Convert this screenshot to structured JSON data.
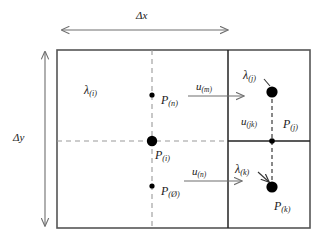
{
  "figure": {
    "type": "diagram",
    "title": "",
    "colors": {
      "outline": "#555555",
      "divider": "#222222",
      "dashed": "#9a9a9a",
      "arrow": "#6e6e6e",
      "text": "#1a1a1a",
      "node": "#000000",
      "background": "#ffffff"
    },
    "dimensions": [
      {
        "id": "dx",
        "label_base": "Δx",
        "label_sub": "",
        "orientation": "horizontal"
      },
      {
        "id": "dy",
        "label_base": "Δy",
        "label_sub": "",
        "orientation": "vertical"
      }
    ],
    "region_labels": [
      {
        "id": "lambda-i",
        "base": "λ",
        "sub": "(i)"
      },
      {
        "id": "lambda-j",
        "base": "λ",
        "sub": "(j)"
      },
      {
        "id": "lambda-k",
        "base": "λ",
        "sub": "(k)"
      }
    ],
    "point_labels": [
      {
        "id": "p-n",
        "base": "P",
        "sub": "(n)"
      },
      {
        "id": "p-i",
        "base": "P",
        "sub": "(i)"
      },
      {
        "id": "p-oslash",
        "base": "P",
        "sub": "(Ø)"
      },
      {
        "id": "p-j",
        "base": "P",
        "sub": "(j)"
      },
      {
        "id": "p-k",
        "base": "P",
        "sub": "(k)"
      }
    ],
    "flux_labels": [
      {
        "id": "u-m",
        "base": "u",
        "sub": "(m)"
      },
      {
        "id": "u-n",
        "base": "u",
        "sub": "(n)"
      },
      {
        "id": "u-jk",
        "base": "u",
        "sub": "(jk)"
      }
    ]
  }
}
